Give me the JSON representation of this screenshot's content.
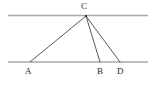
{
  "figure": {
    "kind": "geometry-diagram",
    "width": 154,
    "height": 88,
    "background_color": "#ffffff"
  },
  "colors": {
    "parallel_line": "#a9a9a9",
    "triangle_line": "#3a3a3a",
    "label_text": "#2b2b2b",
    "vertex_dot": "#2b2b2b"
  },
  "parallel_lines": [
    {
      "name": "upper-parallel-line",
      "x1": 8,
      "y1": 15.5,
      "x2": 148,
      "y2": 15.5,
      "stroke_width": 1.6
    },
    {
      "name": "lower-parallel-line",
      "x1": 8,
      "y1": 62,
      "x2": 148,
      "y2": 62,
      "stroke_width": 1.6
    }
  ],
  "points": [
    {
      "id": "C",
      "label": "C",
      "x": 86,
      "y": 16,
      "on": "upper-parallel-line"
    },
    {
      "id": "A",
      "label": "A",
      "x": 30,
      "y": 62,
      "on": "lower-parallel-line"
    },
    {
      "id": "B",
      "label": "B",
      "x": 100,
      "y": 62,
      "on": "lower-parallel-line"
    },
    {
      "id": "D",
      "label": "D",
      "x": 120,
      "y": 62,
      "on": "lower-parallel-line"
    }
  ],
  "segments": [
    {
      "name": "segment-CA",
      "from": "C",
      "to": "A",
      "x1": 86,
      "y1": 16,
      "x2": 30,
      "y2": 62
    },
    {
      "name": "segment-CB",
      "from": "C",
      "to": "B",
      "x1": 86,
      "y1": 16,
      "x2": 100,
      "y2": 62
    },
    {
      "name": "segment-CD",
      "from": "C",
      "to": "D",
      "x1": 86,
      "y1": 16,
      "x2": 120,
      "y2": 62
    },
    {
      "name": "segment-AD",
      "from": "A",
      "to": "D",
      "x1": 30,
      "y1": 62,
      "x2": 120,
      "y2": 62
    }
  ],
  "labels": {
    "C": "C",
    "A": "A",
    "B": "B",
    "D": "D"
  }
}
